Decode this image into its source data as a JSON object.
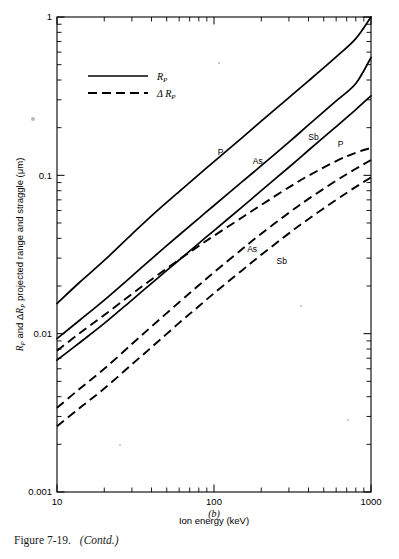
{
  "figure": {
    "caption_number": "Figure 7-19.",
    "caption_contd": "(Contd.)",
    "panel_letter": "(b)"
  },
  "chart_data": {
    "type": "line",
    "title": "",
    "xlabel": "Ion energy (keV)",
    "ylabel": "R_P and ΔR_P projected range and straggle (μm)",
    "ylabel_parts": {
      "r_symbol": "R",
      "r_subscript": "P",
      "conjunction": "and",
      "delta": "Δ",
      "rest": "projected range and straggle (μm)"
    },
    "xscale": "log",
    "yscale": "log",
    "xlim": [
      10,
      1000
    ],
    "ylim": [
      0.001,
      1
    ],
    "grid": false,
    "x_tick_labels": [
      "10",
      "100",
      "1000"
    ],
    "x_tick_values": [
      10,
      100,
      1000
    ],
    "y_tick_labels": [
      "1",
      "0.1",
      "0.01",
      "0.001"
    ],
    "y_tick_values": [
      1,
      0.1,
      0.01,
      0.001
    ],
    "legend_position": "upper-left-inside",
    "legend": [
      {
        "style": "solid",
        "label_symbol": "R",
        "label_sub": "P",
        "label_prefix": ""
      },
      {
        "style": "dashed",
        "label_symbol": "R",
        "label_sub": "P",
        "label_prefix": "Δ "
      }
    ],
    "annotations": [
      {
        "text": "P",
        "x": 110,
        "y": 0.135,
        "series": "Rp-P"
      },
      {
        "text": "As",
        "x": 190,
        "y": 0.118,
        "series": "Rp-As"
      },
      {
        "text": "Sb",
        "x": 430,
        "y": 0.168,
        "series": "Rp-Sb"
      },
      {
        "text": "P",
        "x": 640,
        "y": 0.15,
        "series": "dRp-P"
      },
      {
        "text": "As",
        "x": 175,
        "y": 0.033,
        "series": "dRp-As"
      },
      {
        "text": "Sb",
        "x": 270,
        "y": 0.0276,
        "series": "dRp-Sb"
      }
    ],
    "series": [
      {
        "name": "Rp-P",
        "style": "solid",
        "ion": "P",
        "quantity": "Rp",
        "x": [
          10,
          14,
          20,
          30,
          40,
          60,
          80,
          100,
          150,
          200,
          300,
          400,
          600,
          800,
          1000
        ],
        "values": [
          0.0155,
          0.0212,
          0.029,
          0.0425,
          0.0555,
          0.079,
          0.101,
          0.122,
          0.172,
          0.22,
          0.31,
          0.395,
          0.56,
          0.73,
          1.0
        ]
      },
      {
        "name": "Rp-As",
        "style": "solid",
        "ion": "As",
        "quantity": "Rp",
        "x": [
          10,
          14,
          20,
          30,
          40,
          60,
          80,
          100,
          150,
          200,
          300,
          400,
          600,
          800,
          1000
        ],
        "values": [
          0.0093,
          0.0122,
          0.0163,
          0.0231,
          0.0297,
          0.042,
          0.0535,
          0.0645,
          0.0905,
          0.115,
          0.162,
          0.208,
          0.295,
          0.38,
          0.555
        ]
      },
      {
        "name": "Rp-Sb",
        "style": "solid",
        "ion": "Sb",
        "quantity": "Rp",
        "x": [
          10,
          14,
          20,
          30,
          40,
          60,
          80,
          100,
          150,
          200,
          300,
          400,
          600,
          800,
          1000
        ],
        "values": [
          0.0068,
          0.0088,
          0.0116,
          0.0163,
          0.0208,
          0.0292,
          0.0372,
          0.0448,
          0.0628,
          0.08,
          0.1125,
          0.144,
          0.203,
          0.26,
          0.318
        ]
      },
      {
        "name": "dRp-P",
        "style": "dashed",
        "ion": "P",
        "quantity": "dRp",
        "x": [
          10,
          14,
          20,
          30,
          40,
          60,
          80,
          100,
          150,
          200,
          300,
          400,
          600,
          800,
          1000
        ],
        "values": [
          0.0078,
          0.0101,
          0.0131,
          0.0178,
          0.022,
          0.0294,
          0.0358,
          0.0415,
          0.054,
          0.065,
          0.084,
          0.0995,
          0.123,
          0.139,
          0.149
        ]
      },
      {
        "name": "dRp-As",
        "style": "dashed",
        "ion": "As",
        "quantity": "dRp",
        "x": [
          10,
          14,
          20,
          30,
          40,
          60,
          80,
          100,
          150,
          200,
          300,
          400,
          600,
          800,
          1000
        ],
        "values": [
          0.0034,
          0.0045,
          0.006,
          0.0086,
          0.0111,
          0.0158,
          0.0202,
          0.0244,
          0.034,
          0.0428,
          0.058,
          0.071,
          0.0925,
          0.11,
          0.125
        ]
      },
      {
        "name": "dRp-Sb",
        "style": "dashed",
        "ion": "Sb",
        "quantity": "dRp",
        "x": [
          10,
          14,
          20,
          30,
          40,
          60,
          80,
          100,
          150,
          200,
          300,
          400,
          600,
          800,
          1000
        ],
        "values": [
          0.0026,
          0.0034,
          0.0045,
          0.0064,
          0.0082,
          0.0117,
          0.0149,
          0.018,
          0.025,
          0.0315,
          0.043,
          0.053,
          0.07,
          0.0845,
          0.097
        ]
      }
    ]
  },
  "plot_geometry": {
    "left": 57,
    "right": 371,
    "top": 17,
    "bottom": 492
  }
}
